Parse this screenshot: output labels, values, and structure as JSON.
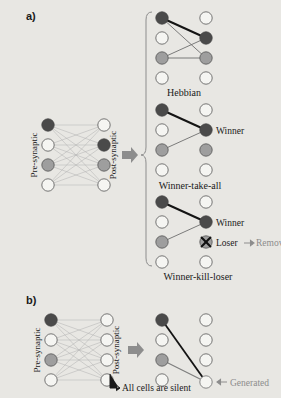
{
  "figure": {
    "background_color": "#e8e7e3",
    "panels": [
      {
        "letter": "a)",
        "left_network": {
          "pre_label": "Pre-synaptic",
          "post_label": "Post-synaptic",
          "pre_nodes": [
            "dark",
            "white",
            "gray",
            "white"
          ],
          "post_nodes": [
            "white",
            "dark",
            "gray",
            "white"
          ],
          "connections": "all-to-all"
        },
        "outcomes": [
          {
            "caption": "Hebbian",
            "pre_nodes": [
              "dark",
              "white",
              "gray",
              "white"
            ],
            "post_nodes": [
              "white",
              "dark",
              "gray",
              "white"
            ],
            "edges": [
              {
                "from": 0,
                "to": 1,
                "weight": "strong"
              },
              {
                "from": 0,
                "to": 2,
                "weight": "weak"
              },
              {
                "from": 2,
                "to": 1,
                "weight": "weak"
              },
              {
                "from": 2,
                "to": 2,
                "weight": "weak"
              }
            ],
            "annotations": []
          },
          {
            "caption": "Winner-take-all",
            "pre_nodes": [
              "dark",
              "white",
              "gray",
              "white"
            ],
            "post_nodes": [
              "white",
              "dark",
              "gray",
              "white"
            ],
            "edges": [
              {
                "from": 0,
                "to": 1,
                "weight": "strong"
              },
              {
                "from": 2,
                "to": 1,
                "weight": "weak"
              }
            ],
            "annotations": [
              {
                "text": "Winner",
                "target_row": 1,
                "color": "#1a1a1a"
              }
            ]
          },
          {
            "caption": "Winner-kill-loser",
            "pre_nodes": [
              "dark",
              "white",
              "gray",
              "white"
            ],
            "post_nodes": [
              "white",
              "dark",
              "gray-killed",
              "white"
            ],
            "edges": [
              {
                "from": 0,
                "to": 1,
                "weight": "strong"
              },
              {
                "from": 2,
                "to": 1,
                "weight": "weak"
              }
            ],
            "annotations": [
              {
                "text": "Winner",
                "target_row": 1,
                "color": "#1a1a1a"
              },
              {
                "text": "Loser",
                "target_row": 2,
                "color": "#1a1a1a"
              },
              {
                "text": "Removed",
                "target_row": 2,
                "color": "#8d8d8d"
              }
            ]
          }
        ]
      },
      {
        "letter": "b)",
        "left_network": {
          "pre_label": "Pre-synaptic",
          "post_label": "Post-synaptic",
          "pre_nodes": [
            "dark",
            "white",
            "gray",
            "white"
          ],
          "post_nodes": [
            "white",
            "white",
            "white",
            "white"
          ],
          "connections": "all-to-all",
          "note": "All cells are silent"
        },
        "result": {
          "pre_nodes": [
            "dark",
            "white",
            "gray",
            "white"
          ],
          "post_nodes": [
            "white",
            "white",
            "white",
            "white"
          ],
          "generated_node": "white",
          "generated_label": "Generated",
          "edges": [
            {
              "from": 0,
              "to": "generated",
              "weight": "strong"
            },
            {
              "from": 2,
              "to": "generated",
              "weight": "weak"
            }
          ]
        }
      }
    ],
    "colors": {
      "node_dark": "#4a4a4a",
      "node_gray": "#9e9e9e",
      "node_white": "#f5f5f2",
      "node_stroke": "#555555",
      "edge_strong": "#141414",
      "edge_weak": "#6e6e6e",
      "edge_faint": "#a8a8a8",
      "arrow_gray": "#8d8d8d",
      "text_dark": "#1a1a1a",
      "text_gray": "#8d8d8d"
    }
  }
}
